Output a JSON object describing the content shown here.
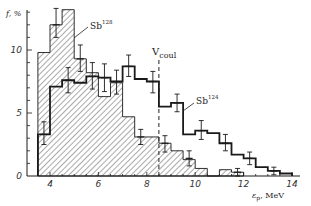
{
  "chart_data": {
    "type": "bar",
    "subtype": "step-histogram",
    "title": "",
    "xlabel": "ε_p, MeV",
    "ylabel": "f, %",
    "xlim": [
      3,
      14.5
    ],
    "ylim": [
      0,
      13.5
    ],
    "xticks": [
      4,
      6,
      8,
      10,
      12,
      14
    ],
    "yticks": [
      0,
      5,
      10
    ],
    "grid": false,
    "bin_width": 0.5,
    "annotations": [
      {
        "text": "V_coul",
        "x": 8.5,
        "style": "dashed vertical line"
      },
      {
        "text": "Sb128",
        "points_to": "hatched histogram"
      },
      {
        "text": "Sb124",
        "points_to": "open step histogram"
      }
    ],
    "series": [
      {
        "name": "Sb128",
        "style": "hatched filled",
        "bin_edges": [
          3.5,
          4.0,
          4.5,
          5.0,
          5.5,
          6.0,
          6.5,
          7.0,
          7.5,
          8.0,
          8.5,
          9.0,
          9.5,
          10.0,
          10.5,
          11.0,
          11.5,
          12.0
        ],
        "values": [
          9.8,
          12.0,
          13.2,
          9.3,
          8.2,
          6.3,
          7.4,
          4.7,
          3.1,
          3.1,
          2.6,
          2.0,
          1.3,
          0.6,
          0.0,
          0.5,
          0.3
        ],
        "errors": [
          {
            "x": 4.25,
            "y": 12.0,
            "lo": 11.0,
            "hi": 13.3
          },
          {
            "x": 5.25,
            "y": 9.3,
            "lo": 8.3,
            "hi": 10.4
          },
          {
            "x": 7.75,
            "y": 3.1,
            "lo": 2.5,
            "hi": 3.7
          },
          {
            "x": 8.75,
            "y": 2.6,
            "lo": 1.9,
            "hi": 3.2
          },
          {
            "x": 9.75,
            "y": 1.4,
            "lo": 0.8,
            "hi": 2.0
          },
          {
            "x": 11.75,
            "y": 0.3,
            "lo": 0.0,
            "hi": 0.6
          }
        ]
      },
      {
        "name": "Sb124",
        "style": "open step line",
        "bin_edges": [
          3.5,
          4.0,
          4.5,
          5.0,
          5.5,
          6.0,
          6.5,
          7.0,
          7.5,
          8.0,
          8.5,
          9.0,
          9.5,
          10.0,
          10.5,
          11.0,
          11.5,
          12.0,
          12.5,
          13.0,
          13.5,
          14.0
        ],
        "values": [
          3.3,
          7.1,
          7.6,
          7.4,
          7.9,
          7.8,
          7.5,
          8.7,
          7.7,
          7.5,
          5.5,
          5.8,
          3.3,
          3.6,
          3.4,
          2.6,
          1.7,
          1.4,
          0.7,
          0.4,
          0.2
        ],
        "errors": [
          {
            "x": 3.75,
            "y": 3.3,
            "lo": 2.5,
            "hi": 4.3
          },
          {
            "x": 4.75,
            "y": 7.6,
            "lo": 6.6,
            "hi": 8.6
          },
          {
            "x": 5.75,
            "y": 7.9,
            "lo": 6.9,
            "hi": 9.0
          },
          {
            "x": 6.25,
            "y": 7.8,
            "lo": 6.7,
            "hi": 8.9
          },
          {
            "x": 6.75,
            "y": 7.5,
            "lo": 6.5,
            "hi": 8.4
          },
          {
            "x": 7.25,
            "y": 8.7,
            "lo": 7.9,
            "hi": 9.6
          },
          {
            "x": 8.25,
            "y": 7.5,
            "lo": 6.6,
            "hi": 8.3
          },
          {
            "x": 9.25,
            "y": 5.8,
            "lo": 5.1,
            "hi": 6.5
          },
          {
            "x": 10.25,
            "y": 3.6,
            "lo": 2.9,
            "hi": 4.4
          },
          {
            "x": 11.25,
            "y": 2.6,
            "lo": 2.0,
            "hi": 3.3
          },
          {
            "x": 12.25,
            "y": 1.4,
            "lo": 0.9,
            "hi": 1.9
          },
          {
            "x": 13.25,
            "y": 0.4,
            "lo": 0.1,
            "hi": 0.7
          }
        ]
      }
    ]
  },
  "labels": {
    "ylabel": "f, %",
    "xlabel": "ε",
    "xlabel_sub": "p",
    "xlabel_unit": ", MeV",
    "vcoul_main": "V",
    "vcoul_sub": "coul",
    "sb128_main": "Sb",
    "sb128_sup": "128",
    "sb124_main": "Sb",
    "sb124_sup": "124",
    "xtick_labels": [
      "4",
      "6",
      "8",
      "10",
      "12",
      "14"
    ],
    "ytick_labels": [
      "0",
      "5",
      "10"
    ]
  },
  "colors": {
    "ink": "#1a1a1a",
    "hatch": "#555555",
    "background": "#ffffff"
  }
}
